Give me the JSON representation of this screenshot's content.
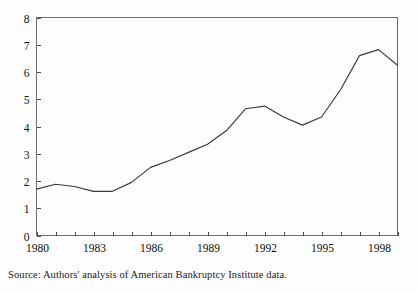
{
  "source_note": "Source: Authors' analysis of American Bankruptcy Institute data.",
  "chart_data": {
    "type": "line",
    "title": "",
    "subtitle": "",
    "xlabel": "",
    "ylabel": "",
    "xlim": [
      1980,
      1999
    ],
    "ylim": [
      0,
      8
    ],
    "yticks": [
      0,
      1,
      2,
      3,
      4,
      5,
      6,
      7,
      8
    ],
    "ytick_labels": [
      "0",
      "1",
      "2",
      "3",
      "4",
      "5",
      "6",
      "7",
      "8"
    ],
    "xticks": [
      1980,
      1981,
      1982,
      1983,
      1984,
      1985,
      1986,
      1987,
      1988,
      1989,
      1990,
      1991,
      1992,
      1993,
      1994,
      1995,
      1996,
      1997,
      1998,
      1999
    ],
    "xtick_labels": [
      "1980",
      "",
      "",
      "1983",
      "",
      "",
      "1986",
      "",
      "",
      "1989",
      "",
      "",
      "1992",
      "",
      "",
      "1995",
      "",
      "",
      "1998",
      ""
    ],
    "labeled_xticks": [
      "1980",
      "1983",
      "1986",
      "1989",
      "1992",
      "1995",
      "1998"
    ],
    "grid": false,
    "legend": false,
    "legend_position": "none",
    "line_color": "#3a3a3a",
    "axis_color": "#6e6e6e",
    "background_color": "#fdfdfd",
    "x": [
      1980,
      1981,
      1982,
      1983,
      1984,
      1985,
      1986,
      1987,
      1988,
      1989,
      1990,
      1991,
      1992,
      1993,
      1994,
      1995,
      1996,
      1997,
      1998,
      1999
    ],
    "series": [
      {
        "name": "Bankruptcy filings per 1,000 population",
        "values": [
          1.7,
          1.88,
          1.8,
          1.62,
          1.62,
          1.95,
          2.5,
          2.75,
          3.05,
          3.35,
          3.85,
          4.65,
          4.75,
          4.35,
          4.05,
          4.35,
          5.35,
          6.6,
          6.82,
          6.25
        ]
      }
    ]
  }
}
